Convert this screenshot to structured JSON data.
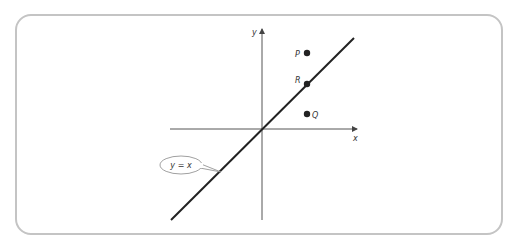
{
  "diagram": {
    "axes": {
      "x_label": "x",
      "y_label": "y"
    },
    "line_label": "y = x",
    "points": [
      {
        "name": "P",
        "label": "P",
        "position": "above line"
      },
      {
        "name": "R",
        "label": "R",
        "position": "on line"
      },
      {
        "name": "Q",
        "label": "Q",
        "position": "below line"
      }
    ],
    "colors": {
      "frame": "#c4c4c4",
      "line": "#222222",
      "axes": "#555555",
      "callout": "#888888"
    }
  }
}
